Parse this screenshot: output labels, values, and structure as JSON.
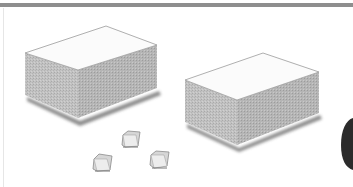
{
  "illustration": {
    "description": "Two large isometric gray boxes with three small cubes",
    "colors": {
      "border_bar": "#8e8e8e",
      "box_top": "#fbfbfb",
      "box_side": "#bdbdbd",
      "box_side_dark": "#a8a8a8",
      "shadow": "#6f6f6f",
      "edge": "#9a9a9a",
      "dark_shape": "#2b2b2b"
    },
    "objects": [
      {
        "name": "large-box-left"
      },
      {
        "name": "large-box-right"
      },
      {
        "name": "small-cube-top"
      },
      {
        "name": "small-cube-left"
      },
      {
        "name": "small-cube-right"
      },
      {
        "name": "dark-rounded-shape"
      }
    ]
  }
}
